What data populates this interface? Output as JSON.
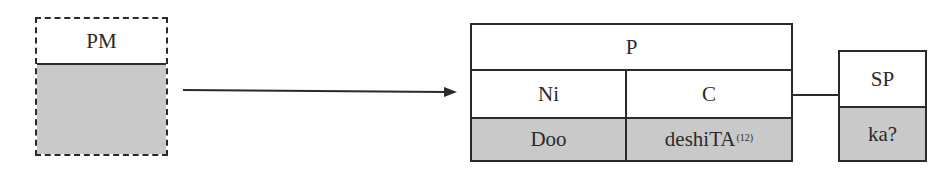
{
  "diagram": {
    "pm_box": {
      "label": "PM",
      "body": ""
    },
    "p_box": {
      "label": "P",
      "columns": [
        {
          "label": "Ni",
          "value": "Doo"
        },
        {
          "label": "C",
          "value": "deshiTA",
          "superscript": "(12)"
        }
      ]
    },
    "sp_box": {
      "label": "SP",
      "value": "ka?"
    },
    "arrow": {
      "from": "PM",
      "to": "P"
    },
    "connector": {
      "from": "P",
      "to": "SP"
    },
    "colors": {
      "line": "#2a2a2a",
      "shade": "#c9c9c9",
      "background": "#ffffff"
    }
  }
}
